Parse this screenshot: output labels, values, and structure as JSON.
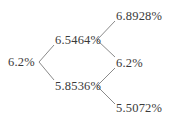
{
  "diagram": {
    "type": "binomial-interest-rate-tree",
    "steps": 2,
    "nodes": {
      "root": {
        "label": "6.2%"
      },
      "up": {
        "label": "6.5464%"
      },
      "down": {
        "label": "5.8536%"
      },
      "up_up": {
        "label": "6.8928%"
      },
      "up_down": {
        "label": "6.2%"
      },
      "down_down": {
        "label": "5.5072%"
      }
    },
    "edges": [
      {
        "from": "root",
        "to": "up"
      },
      {
        "from": "root",
        "to": "down"
      },
      {
        "from": "up",
        "to": "up_up"
      },
      {
        "from": "up",
        "to": "up_down"
      },
      {
        "from": "down",
        "to": "up_down"
      },
      {
        "from": "down",
        "to": "down_down"
      }
    ],
    "colors": {
      "text": "#3a3a3a",
      "line": "#8a8a8a",
      "background": "#ffffff"
    }
  }
}
